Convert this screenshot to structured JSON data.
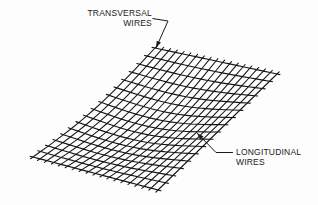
{
  "figure": {
    "background_color": "#fdfdfd",
    "ink_color": "#151515",
    "labels": {
      "transversal": {
        "line1": "TRANSVERSAL",
        "line2": "WIRES",
        "align": "right",
        "position": {
          "x": 152,
          "y": 16
        }
      },
      "longitudinal": {
        "line1": "LONGITUDINAL",
        "line2": "WIRES",
        "align": "left",
        "position": {
          "x": 236,
          "y": 155
        }
      }
    },
    "leaders": {
      "transversal": {
        "from": {
          "x": 157,
          "y": 12
        },
        "to": {
          "x": 156,
          "y": 48
        },
        "arrow": "down-left"
      },
      "longitudinal": {
        "from": {
          "x": 232,
          "y": 152
        },
        "to": {
          "x": 197,
          "y": 133
        },
        "arrow": "up-left"
      }
    },
    "mesh": {
      "description": "Parallelogram sheet of welded wire mesh drawn in perspective",
      "corners": {
        "top": {
          "x": 155,
          "y": 48
        },
        "right": {
          "x": 277,
          "y": 74
        },
        "bottom": {
          "x": 158,
          "y": 190
        },
        "left": {
          "x": 33,
          "y": 157
        }
      },
      "longitudinal_wire_count": 17,
      "transversal_wire_count": 19,
      "wire_overhang_px": 3
    }
  }
}
